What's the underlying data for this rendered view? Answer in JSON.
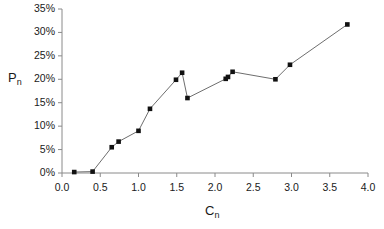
{
  "chart_data": {
    "type": "line",
    "title": "",
    "subtitle": "",
    "xlabel": "C_n",
    "ylabel": "P_n",
    "xlabel_base": "C",
    "xlabel_sub": "n",
    "ylabel_base": "P",
    "ylabel_sub": "n",
    "xlim": [
      0.0,
      4.0
    ],
    "ylim": [
      0,
      35
    ],
    "grid": false,
    "legend": false,
    "legend_position": "none",
    "y_unit": "percent",
    "xticks": [
      0.0,
      0.5,
      1.0,
      1.5,
      2.0,
      2.5,
      3.0,
      3.5,
      4.0
    ],
    "xtick_labels": [
      "0.0",
      "0.5",
      "1.0",
      "1.5",
      "2.0",
      "2.5",
      "3.0",
      "3.5",
      "4.0"
    ],
    "yticks": [
      0,
      5,
      10,
      15,
      20,
      25,
      30,
      35
    ],
    "ytick_labels": [
      "0%",
      "5%",
      "10%",
      "15%",
      "20%",
      "25%",
      "30%",
      "35%"
    ],
    "series": [
      {
        "name": "Pn vs Cn",
        "marker": "square",
        "marker_color": "#111111",
        "line_color": "#6e6e6e",
        "x": [
          0.16,
          0.4,
          0.65,
          0.74,
          1.0,
          1.15,
          1.49,
          1.57,
          1.64,
          2.14,
          2.17,
          2.23,
          2.79,
          2.98,
          3.73
        ],
        "y": [
          0.2,
          0.3,
          5.5,
          6.7,
          9.0,
          13.7,
          19.9,
          21.4,
          16.0,
          20.1,
          20.5,
          21.6,
          20.0,
          23.1,
          31.7
        ]
      }
    ],
    "axis_color": "#8a8a8a",
    "text_color": "#1a1a1a"
  },
  "layout": {
    "plot_left_px": 62,
    "plot_right_px": 368,
    "plot_top_px": 9,
    "plot_bottom_px": 173
  }
}
